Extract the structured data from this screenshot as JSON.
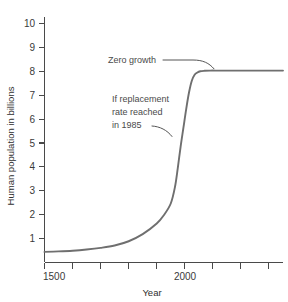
{
  "chart_data": {
    "type": "line",
    "title": "",
    "xlabel": "Year",
    "ylabel": "Human population in billions",
    "xlim": [
      1500,
      2350
    ],
    "ylim": [
      0,
      10.4
    ],
    "grid": false,
    "legend": "none",
    "x_ticks": [
      1500,
      1600,
      1700,
      1800,
      1900,
      2000,
      2100,
      2200,
      2300
    ],
    "x_tick_labels": [
      "1500",
      "",
      "",
      "",
      "",
      "2000",
      "",
      "",
      ""
    ],
    "y_ticks": [
      1,
      2,
      3,
      4,
      5,
      6,
      7,
      8,
      9,
      10
    ],
    "y_tick_labels": [
      "1",
      "2",
      "3",
      "4",
      "5",
      "6",
      "7",
      "8",
      "9",
      "10"
    ],
    "series": [
      {
        "name": "Human population projection",
        "color": "#6f6f6f",
        "x": [
          1500,
          1550,
          1600,
          1650,
          1700,
          1750,
          1800,
          1850,
          1900,
          1925,
          1950,
          1965,
          1975,
          1985,
          1995,
          2005,
          2015,
          2025,
          2035,
          2045,
          2055,
          2070,
          2090,
          2120,
          2160,
          2200,
          2250,
          2300,
          2350
        ],
        "y": [
          0.45,
          0.47,
          0.5,
          0.55,
          0.62,
          0.72,
          0.9,
          1.2,
          1.65,
          2.0,
          2.5,
          3.2,
          4.0,
          4.9,
          5.7,
          6.5,
          7.2,
          7.7,
          7.95,
          8.05,
          8.1,
          8.12,
          8.13,
          8.13,
          8.13,
          8.13,
          8.13,
          8.13,
          8.13
        ]
      }
    ],
    "annotations": [
      {
        "id": "zero-growth",
        "lines": [
          "Zero growth"
        ],
        "text_x": 1850,
        "text_y": 9.0,
        "points_to_x": 2090,
        "points_to_y": 8.15
      },
      {
        "id": "replacement-rate",
        "lines": [
          "If replacement",
          "rate reached",
          "in 1985"
        ],
        "text_x": 1780,
        "text_y": 6.9,
        "points_to_x": 2000,
        "points_to_y": 5.35
      }
    ]
  },
  "colors": {
    "curve": "#6f6f6f",
    "axis": "#4a4a4a",
    "text": "#3a3a3a",
    "annotation": "#4a4a4a",
    "background": "#ffffff"
  }
}
